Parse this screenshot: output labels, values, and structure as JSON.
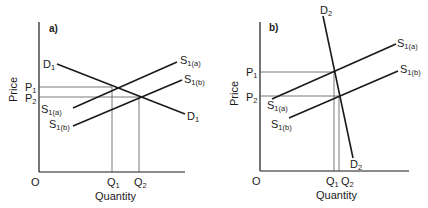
{
  "panels": [
    {
      "id": "a",
      "tag": "a)",
      "axis": {
        "x_label": "Quantity",
        "y_label": "Price",
        "origin": "O"
      },
      "price_levels": [
        {
          "label": "P",
          "sub": "1"
        },
        {
          "label": "P",
          "sub": "2"
        }
      ],
      "quantity_levels": [
        {
          "label": "Q",
          "sub": "1"
        },
        {
          "label": "Q",
          "sub": "2"
        }
      ],
      "curves": {
        "demand": {
          "label": "D",
          "sub": "1"
        },
        "supply_a": {
          "label": "S",
          "sub": "1(a)"
        },
        "supply_b": {
          "label": "S",
          "sub": "1(b)"
        }
      }
    },
    {
      "id": "b",
      "tag": "b)",
      "axis": {
        "x_label": "Quantity",
        "y_label": "Price",
        "origin": "O"
      },
      "price_levels": [
        {
          "label": "P",
          "sub": "1"
        },
        {
          "label": "P",
          "sub": "2"
        }
      ],
      "quantity_levels": [
        {
          "label": "Q",
          "sub": "1"
        },
        {
          "label": "Q",
          "sub": "2"
        }
      ],
      "curves": {
        "demand": {
          "label": "D",
          "sub": "2"
        },
        "supply_a": {
          "label": "S",
          "sub": "1(a)"
        },
        "supply_b": {
          "label": "S",
          "sub": "1(b)"
        }
      }
    }
  ],
  "colors": {
    "line": "#1a1a1a",
    "guide": "#555555",
    "background": "#ffffff"
  }
}
